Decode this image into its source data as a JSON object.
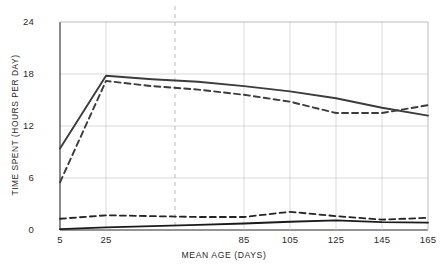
{
  "chart_data": {
    "type": "line",
    "title": "",
    "xlabel": "MEAN AGE (DAYS)",
    "ylabel": "TIME SPENT (HOURS PER DAY)",
    "xlim": [
      5,
      165
    ],
    "ylim": [
      0,
      24
    ],
    "xticks": [
      5,
      25,
      45,
      65,
      85,
      105,
      125,
      145,
      165
    ],
    "xtick_labels": [
      "5",
      "25",
      "",
      "",
      "85",
      "105",
      "125",
      "145",
      "165"
    ],
    "yticks": [
      0,
      6,
      12,
      18,
      24
    ],
    "ytick_labels": [
      "0",
      "6",
      "12",
      "18",
      "24"
    ],
    "grid": "both",
    "legend": "none",
    "annotations": [
      {
        "name": "vertical-reference-line",
        "x": 55,
        "style": "dashed",
        "color": "#b9b9b9"
      }
    ],
    "x": [
      5,
      25,
      45,
      65,
      85,
      105,
      125,
      145,
      165
    ],
    "series": [
      {
        "name": "upper-solid",
        "style": "solid",
        "color": "#3c3c3c",
        "values": [
          9.4,
          17.8,
          17.4,
          17.1,
          16.6,
          16.0,
          15.2,
          14.1,
          13.2
        ]
      },
      {
        "name": "upper-dashed",
        "style": "dashed",
        "color": "#3c3c3c",
        "values": [
          5.5,
          17.2,
          16.6,
          16.2,
          15.6,
          14.8,
          13.5,
          13.5,
          14.4
        ]
      },
      {
        "name": "lower-dashed",
        "style": "dashed",
        "color": "#242424",
        "values": [
          1.3,
          1.7,
          1.6,
          1.5,
          1.5,
          2.1,
          1.6,
          1.2,
          1.4
        ]
      },
      {
        "name": "lower-solid",
        "style": "solid",
        "color": "#1a1a1a",
        "values": [
          0.1,
          0.3,
          0.45,
          0.6,
          0.75,
          0.95,
          1.1,
          0.9,
          0.85
        ]
      }
    ]
  }
}
